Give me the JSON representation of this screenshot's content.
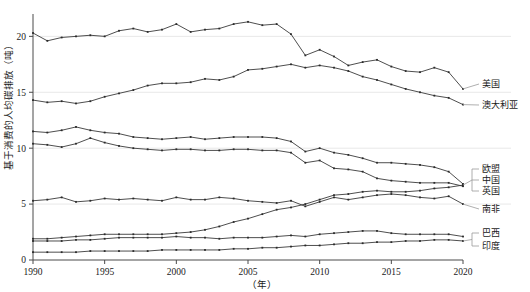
{
  "chart_data": {
    "type": "line",
    "title": "",
    "xlabel": "（年）",
    "ylabel": "基于消费的人均碳排放（吨）",
    "xlim": [
      1990,
      2020
    ],
    "ylim": [
      0,
      22
    ],
    "grid": true,
    "legend_position": "right-inline",
    "x": [
      1990,
      1991,
      1992,
      1993,
      1994,
      1995,
      1996,
      1997,
      1998,
      1999,
      2000,
      2001,
      2002,
      2003,
      2004,
      2005,
      2006,
      2007,
      2008,
      2009,
      2010,
      2011,
      2012,
      2013,
      2014,
      2015,
      2016,
      2017,
      2018,
      2019,
      2020
    ],
    "xticks": [
      "1990",
      "1995",
      "2000",
      "2005",
      "2010",
      "2015",
      "2020"
    ],
    "yticks": [
      "0",
      "5",
      "10",
      "15",
      "20"
    ],
    "series": [
      {
        "name": "美国",
        "label": "美国",
        "values": [
          20.3,
          19.6,
          19.9,
          20.0,
          20.1,
          20.0,
          20.5,
          20.7,
          20.4,
          20.6,
          21.1,
          20.4,
          20.6,
          20.7,
          21.1,
          21.3,
          21.0,
          21.1,
          20.2,
          18.3,
          18.8,
          18.2,
          17.4,
          17.7,
          17.9,
          17.3,
          16.9,
          16.8,
          17.2,
          16.8,
          15.3
        ]
      },
      {
        "name": "澳大利亚",
        "label": "澳大利亚",
        "values": [
          14.3,
          14.1,
          14.2,
          14.0,
          14.2,
          14.6,
          14.9,
          15.2,
          15.6,
          15.8,
          15.8,
          15.9,
          16.2,
          16.1,
          16.4,
          17.0,
          17.1,
          17.3,
          17.5,
          17.2,
          17.4,
          17.2,
          16.9,
          16.4,
          16.1,
          15.7,
          15.3,
          15.0,
          14.7,
          14.5,
          13.9
        ]
      },
      {
        "name": "欧盟",
        "label": "欧盟",
        "values": [
          11.5,
          11.4,
          11.6,
          11.9,
          11.6,
          11.4,
          11.3,
          11.0,
          10.9,
          10.8,
          10.9,
          11.0,
          10.8,
          10.9,
          11.0,
          11.0,
          11.0,
          10.9,
          10.6,
          9.7,
          10.0,
          9.6,
          9.4,
          9.1,
          8.7,
          8.7,
          8.6,
          8.5,
          8.3,
          7.9,
          6.8
        ]
      },
      {
        "name": "英国",
        "label": "英国",
        "values": [
          10.4,
          10.3,
          10.1,
          10.4,
          10.9,
          10.5,
          10.2,
          10.0,
          9.9,
          9.8,
          9.9,
          9.9,
          9.8,
          9.8,
          9.9,
          9.9,
          9.8,
          9.8,
          9.6,
          8.7,
          8.9,
          8.2,
          8.1,
          7.9,
          7.3,
          7.1,
          7.0,
          6.9,
          6.9,
          6.9,
          6.6
        ]
      },
      {
        "name": "中国",
        "label": "中国",
        "values": [
          1.9,
          1.9,
          2.0,
          2.1,
          2.2,
          2.3,
          2.3,
          2.3,
          2.3,
          2.3,
          2.4,
          2.5,
          2.7,
          3.0,
          3.4,
          3.7,
          4.1,
          4.5,
          4.7,
          5.0,
          5.4,
          5.8,
          5.9,
          6.1,
          6.2,
          6.1,
          6.1,
          6.2,
          6.4,
          6.5,
          6.7
        ]
      },
      {
        "name": "南非",
        "label": "南非",
        "values": [
          5.3,
          5.4,
          5.6,
          5.2,
          5.3,
          5.5,
          5.4,
          5.5,
          5.4,
          5.3,
          5.6,
          5.4,
          5.4,
          5.6,
          5.5,
          5.3,
          5.2,
          5.1,
          5.3,
          4.8,
          5.2,
          5.6,
          5.4,
          5.6,
          5.8,
          5.9,
          5.8,
          5.6,
          5.5,
          5.7,
          5.0
        ]
      },
      {
        "name": "巴西",
        "label": "巴西",
        "values": [
          1.7,
          1.7,
          1.7,
          1.8,
          1.8,
          1.9,
          2.0,
          2.0,
          2.0,
          2.0,
          2.1,
          2.0,
          2.0,
          1.9,
          2.0,
          2.0,
          2.0,
          2.1,
          2.2,
          2.1,
          2.3,
          2.4,
          2.5,
          2.6,
          2.6,
          2.4,
          2.3,
          2.3,
          2.3,
          2.3,
          2.1
        ]
      },
      {
        "name": "印度",
        "label": "印度",
        "values": [
          0.7,
          0.7,
          0.7,
          0.7,
          0.8,
          0.8,
          0.8,
          0.8,
          0.8,
          0.9,
          0.9,
          0.9,
          0.9,
          0.9,
          1.0,
          1.0,
          1.1,
          1.1,
          1.2,
          1.3,
          1.3,
          1.4,
          1.5,
          1.5,
          1.6,
          1.6,
          1.7,
          1.7,
          1.8,
          1.8,
          1.7
        ]
      }
    ],
    "legend_entries": [
      {
        "label": "美国"
      },
      {
        "label": "澳大利亚"
      },
      {
        "label": "欧盟"
      },
      {
        "label": "中国"
      },
      {
        "label": "英国"
      },
      {
        "label": "南非"
      },
      {
        "label": "巴西"
      },
      {
        "label": "印度"
      }
    ],
    "colors": {
      "line": "#3a3a3a",
      "axis": "#4a4a4a",
      "grid": "#e8e8e8",
      "text": "#1a1a1a"
    }
  }
}
